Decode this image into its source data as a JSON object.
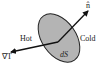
{
  "diagram": {
    "surface_label": "dS",
    "normal_label": "n̂",
    "hot_label": "Hot",
    "cold_label": "Cold",
    "gradient_label": "∇T",
    "colors": {
      "surface_fill": "#b4b4b4",
      "surface_stroke": "#222222",
      "arrow": "#111111",
      "text": "#222222"
    }
  }
}
